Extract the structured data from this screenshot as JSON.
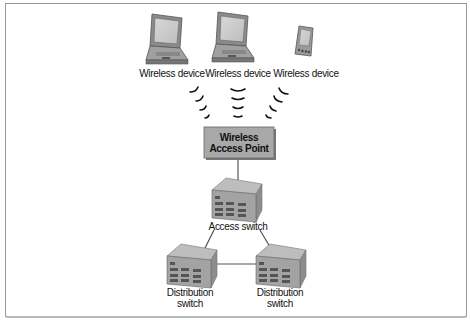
{
  "diagram": {
    "type": "network-topology",
    "devices": [
      {
        "id": "laptop1",
        "kind": "laptop",
        "label": "Wireless device"
      },
      {
        "id": "laptop2",
        "kind": "laptop",
        "label": "Wireless device"
      },
      {
        "id": "pda",
        "kind": "pda",
        "label": "Wireless device"
      }
    ],
    "access_point": {
      "label": "Wireless Access Point",
      "fill": "#a8a8a8"
    },
    "access_switch": {
      "label": "Access switch"
    },
    "distribution_switches": [
      {
        "label_line1": "Distribution",
        "label_line2": "switch"
      },
      {
        "label_line1": "Distribution",
        "label_line2": "switch"
      }
    ],
    "links": [
      {
        "from": "laptop1",
        "to": "access_point",
        "type": "wireless"
      },
      {
        "from": "laptop2",
        "to": "access_point",
        "type": "wireless"
      },
      {
        "from": "pda",
        "to": "access_point",
        "type": "wireless"
      },
      {
        "from": "access_point",
        "to": "access_switch",
        "type": "wired"
      },
      {
        "from": "access_switch",
        "to": "distribution_switch_1",
        "type": "wired"
      },
      {
        "from": "access_switch",
        "to": "distribution_switch_2",
        "type": "wired"
      },
      {
        "from": "distribution_switch_1",
        "to": "distribution_switch_2",
        "type": "wired"
      }
    ]
  }
}
